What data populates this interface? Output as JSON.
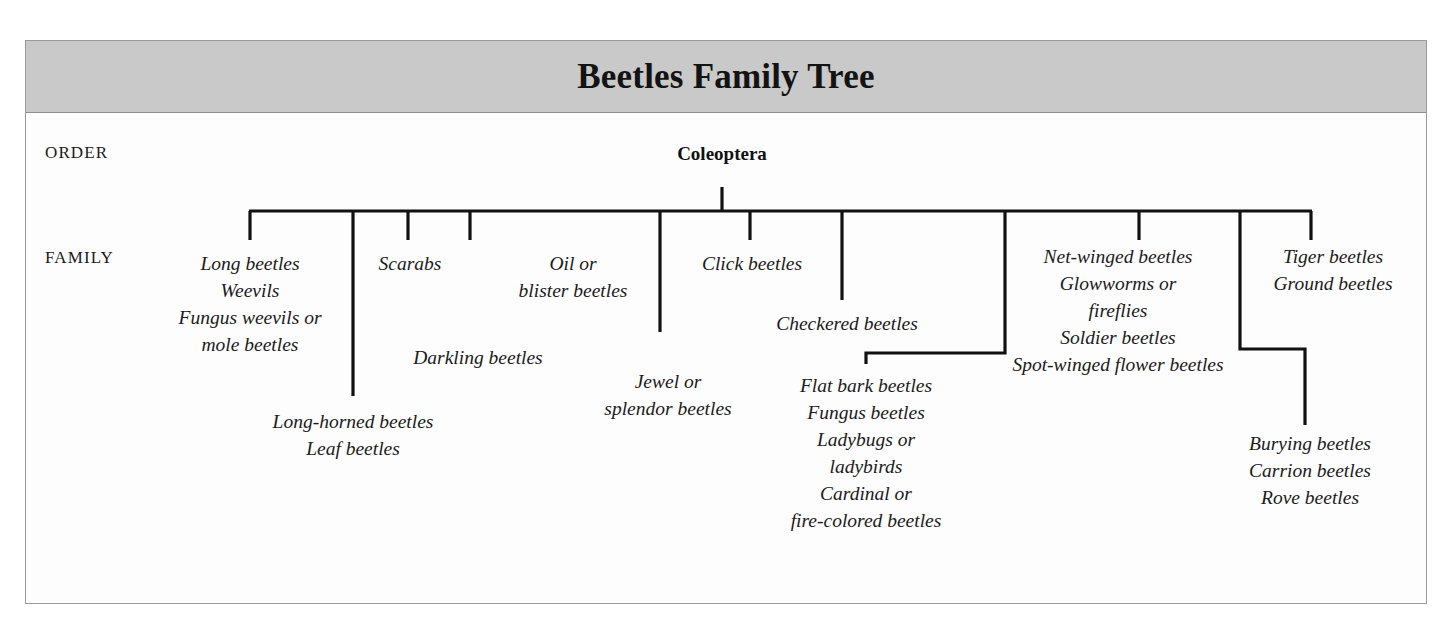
{
  "header": {
    "title": "Beetles Family Tree"
  },
  "ranks": {
    "order_label": "ORDER",
    "family_label": "FAMILY"
  },
  "tree": {
    "root": "Coleoptera",
    "groups": [
      {
        "id": "long-beetles-group",
        "lines": [
          "Long beetles",
          "Weevils",
          "Fungus weevils or",
          "mole beetles"
        ]
      },
      {
        "id": "scarabs-group",
        "lines": [
          "Scarabs"
        ]
      },
      {
        "id": "oil-blister-group",
        "lines": [
          "Oil or",
          "blister beetles"
        ]
      },
      {
        "id": "click-beetles-group",
        "lines": [
          "Click beetles"
        ]
      },
      {
        "id": "net-winged-group",
        "lines": [
          "Net-winged beetles",
          "Glowworms or",
          "fireflies",
          "Soldier beetles",
          "Spot-winged flower beetles"
        ]
      },
      {
        "id": "tiger-ground-group",
        "lines": [
          "Tiger beetles",
          "Ground beetles"
        ]
      },
      {
        "id": "long-horned-group",
        "lines": [
          "Long-horned beetles",
          "Leaf beetles"
        ]
      },
      {
        "id": "darkling-group",
        "lines": [
          "Darkling beetles"
        ]
      },
      {
        "id": "jewel-splendor-group",
        "lines": [
          "Jewel or",
          "splendor beetles"
        ]
      },
      {
        "id": "checkered-group",
        "lines": [
          "Checkered beetles"
        ]
      },
      {
        "id": "flat-bark-group",
        "lines": [
          "Flat bark beetles",
          "Fungus beetles",
          "Ladybugs or",
          "ladybirds",
          "Cardinal or",
          "fire-colored beetles"
        ]
      },
      {
        "id": "burying-group",
        "lines": [
          "Burying beetles",
          "Carrion beetles",
          "Rove beetles"
        ]
      }
    ]
  },
  "colors": {
    "header_band": "#c9c9c9",
    "frame_border": "#9a9a9a",
    "line": "#111111",
    "text": "#1b1b1b",
    "background": "#fdfdfd"
  }
}
